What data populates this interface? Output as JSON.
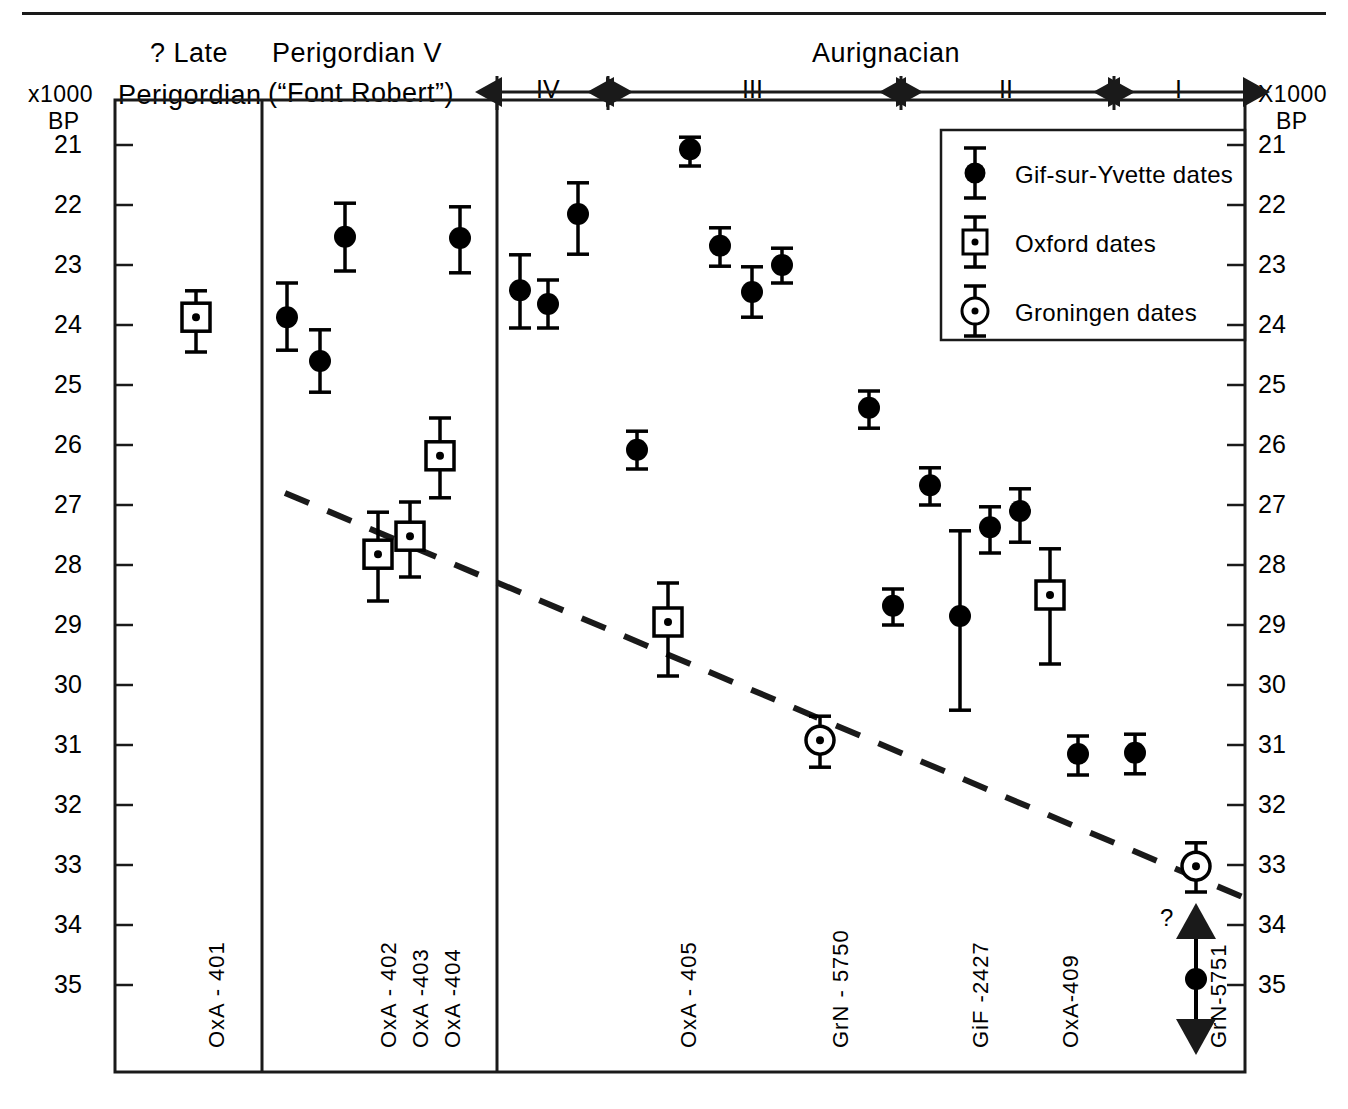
{
  "figure": {
    "axis_title_left": "x1000",
    "axis_title_left_2": "BP",
    "axis_title_right": "X1000",
    "axis_title_right_2": "BP"
  },
  "columns": [
    {
      "id": "late-perigordian",
      "label_line1": "? Late",
      "label_line2": "Perigordian"
    },
    {
      "id": "perigordian-v",
      "label_line1": "Perigordian V",
      "label_line2": "(“Font Robert”)"
    },
    {
      "id": "aurignacian",
      "label_line1": "Aurignacian",
      "label_line2": ""
    }
  ],
  "phases": [
    {
      "id": "phase-iv",
      "label": "IV"
    },
    {
      "id": "phase-iii",
      "label": "III"
    },
    {
      "id": "phase-ii",
      "label": "II"
    },
    {
      "id": "phase-i",
      "label": "I"
    }
  ],
  "legend": {
    "items": [
      {
        "id": "gif",
        "marker": "filled-circle",
        "label": "Gif-sur-Yvette  dates"
      },
      {
        "id": "oxford",
        "marker": "square-dot",
        "label": "Oxford  dates"
      },
      {
        "id": "groningen",
        "marker": "circle-dot",
        "label": "Groningen  dates"
      }
    ]
  },
  "sample_labels": [
    {
      "id": "oxa-401",
      "text": "OxA - 401"
    },
    {
      "id": "oxa-402",
      "text": "OxA - 402"
    },
    {
      "id": "oxa-403",
      "text": "OxA -403"
    },
    {
      "id": "oxa-404",
      "text": "OxA -404"
    },
    {
      "id": "oxa-405",
      "text": "OxA - 405"
    },
    {
      "id": "grn-5750",
      "text": "GrN - 5750"
    },
    {
      "id": "gif-2427",
      "text": "GiF -2427"
    },
    {
      "id": "oxa-409",
      "text": "OxA-409"
    },
    {
      "id": "grn-5751",
      "text": "GrN-5751"
    }
  ],
  "annotations": [
    {
      "id": "open-ended-question",
      "text": "?"
    }
  ],
  "chart_data": {
    "type": "scatter",
    "ylabel": "x1000 BP",
    "ylim": [
      21,
      35
    ],
    "y_inverted": true,
    "yticks": [
      21,
      22,
      23,
      24,
      25,
      26,
      27,
      28,
      29,
      30,
      31,
      32,
      33,
      34,
      35
    ],
    "ytick_labels": [
      "21",
      "22",
      "23",
      "24",
      "25",
      "26",
      "27",
      "28",
      "29",
      "30",
      "31",
      "32",
      "33",
      "34",
      "35"
    ],
    "grid": false,
    "legend_position": "top-right",
    "colors": {
      "marker": "#000000",
      "frame": "#1a1a1a",
      "trend": "#1a1a1a"
    },
    "series": [
      {
        "name": "Gif-sur-Yvette dates",
        "marker": "filled-circle",
        "points": [
          {
            "group": "Perigordian V",
            "x_px": 287,
            "value": 23.87,
            "low": 23.3,
            "high": 24.42
          },
          {
            "group": "Perigordian V",
            "x_px": 320,
            "value": 24.6,
            "low": 24.08,
            "high": 25.12
          },
          {
            "group": "Perigordian V",
            "x_px": 345,
            "value": 22.53,
            "low": 21.97,
            "high": 23.1
          },
          {
            "group": "Perigordian V",
            "x_px": 460,
            "value": 22.55,
            "low": 22.03,
            "high": 23.13
          },
          {
            "group": "Aurignacian IV",
            "x_px": 520,
            "value": 23.42,
            "low": 22.83,
            "high": 24.05
          },
          {
            "group": "Aurignacian IV",
            "x_px": 548,
            "value": 23.65,
            "low": 23.25,
            "high": 24.05
          },
          {
            "group": "Aurignacian IV",
            "x_px": 578,
            "value": 22.15,
            "low": 21.63,
            "high": 22.82
          },
          {
            "group": "Aurignacian III",
            "x_px": 690,
            "value": 21.07,
            "low": 20.87,
            "high": 21.35
          },
          {
            "group": "Aurignacian III",
            "x_px": 720,
            "value": 22.68,
            "low": 22.38,
            "high": 23.02
          },
          {
            "group": "Aurignacian III",
            "x_px": 752,
            "value": 23.45,
            "low": 23.03,
            "high": 23.87
          },
          {
            "group": "Aurignacian III",
            "x_px": 782,
            "value": 23.0,
            "low": 22.72,
            "high": 23.3
          },
          {
            "group": "Aurignacian III",
            "x_px": 637,
            "value": 26.08,
            "low": 25.77,
            "high": 26.4
          },
          {
            "group": "Aurignacian III",
            "x_px": 869,
            "value": 25.38,
            "low": 25.1,
            "high": 25.72
          },
          {
            "group": "Aurignacian II",
            "x_px": 930,
            "value": 26.67,
            "low": 26.38,
            "high": 27.0
          },
          {
            "group": "Aurignacian III",
            "x_px": 893,
            "value": 28.68,
            "low": 28.4,
            "high": 29.0
          },
          {
            "group": "Aurignacian II",
            "x_px": 960,
            "value": 28.85,
            "low": 27.43,
            "high": 30.42
          },
          {
            "group": "Aurignacian II",
            "x_px": 990,
            "value": 27.37,
            "low": 27.03,
            "high": 27.8
          },
          {
            "group": "Aurignacian II",
            "x_px": 1020,
            "value": 27.1,
            "low": 26.73,
            "high": 27.62
          },
          {
            "group": "Aurignacian II",
            "x_px": 1078,
            "value": 31.15,
            "low": 30.85,
            "high": 31.5
          },
          {
            "group": "Aurignacian I",
            "x_px": 1135,
            "value": 31.13,
            "low": 30.82,
            "high": 31.48
          },
          {
            "group": "Aurignacian I",
            "x_px": 1196,
            "value": 34.9,
            "low": null,
            "high": null,
            "open_ended": true
          }
        ]
      },
      {
        "name": "Oxford dates",
        "marker": "square-dot",
        "points": [
          {
            "group": "? Late Perigordian",
            "x_px": 196,
            "value": 23.87,
            "low": 23.43,
            "high": 24.45
          },
          {
            "group": "Perigordian V",
            "x_px": 378,
            "value": 27.82,
            "low": 27.12,
            "high": 28.6
          },
          {
            "group": "Perigordian V",
            "x_px": 410,
            "value": 27.52,
            "low": 26.95,
            "high": 28.2
          },
          {
            "group": "Perigordian V",
            "x_px": 440,
            "value": 26.18,
            "low": 25.55,
            "high": 26.88
          },
          {
            "group": "Aurignacian III",
            "x_px": 668,
            "value": 28.95,
            "low": 28.3,
            "high": 29.85
          },
          {
            "group": "Aurignacian II",
            "x_px": 1050,
            "value": 28.5,
            "low": 27.73,
            "high": 29.65
          }
        ]
      },
      {
        "name": "Groningen dates",
        "marker": "circle-dot",
        "points": [
          {
            "group": "Aurignacian III",
            "x_px": 820,
            "value": 30.92,
            "low": 30.52,
            "high": 31.37
          },
          {
            "group": "Aurignacian I",
            "x_px": 1196,
            "value": 33.02,
            "low": 32.63,
            "high": 33.45
          }
        ]
      }
    ],
    "trend_line": {
      "style": "dashed",
      "from": {
        "x_px": 285,
        "value": 26.8
      },
      "to": {
        "x_px": 1245,
        "value": 33.55
      }
    }
  }
}
